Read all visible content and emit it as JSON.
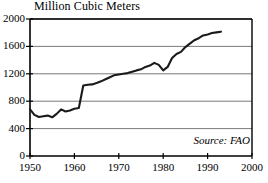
{
  "chart_data": {
    "type": "line",
    "title": "Million Cubic Meters",
    "xlabel": "",
    "ylabel": "",
    "xlim": [
      1950,
      2000
    ],
    "ylim": [
      0,
      2000
    ],
    "grid": true,
    "legend": null,
    "annotations": [
      {
        "name": "source",
        "text": "Source: FAO",
        "position": "bottom-right",
        "style": "italic"
      }
    ],
    "y_ticks": [
      0,
      400,
      800,
      1200,
      1600,
      2000
    ],
    "y_tick_labels": [
      "0",
      "400",
      "800",
      "1200",
      "1600",
      "2000"
    ],
    "x_ticks": [
      1950,
      1960,
      1970,
      1980,
      1990,
      2000
    ],
    "x_tick_labels": [
      "1950",
      "1960",
      "1970",
      "1980",
      "1990",
      "2000"
    ],
    "series": [
      {
        "name": "World fish catch",
        "color": "#1a1a1a",
        "x": [
          1950,
          1951,
          1952,
          1953,
          1954,
          1955,
          1956,
          1957,
          1958,
          1959,
          1960,
          1961,
          1962,
          1963,
          1964,
          1965,
          1966,
          1967,
          1968,
          1969,
          1970,
          1971,
          1972,
          1973,
          1974,
          1975,
          1976,
          1977,
          1978,
          1979,
          1980,
          1981,
          1982,
          1983,
          1984,
          1985,
          1986,
          1987,
          1988,
          1989,
          1990,
          1991,
          1992,
          1993
        ],
        "values": [
          680,
          600,
          570,
          580,
          590,
          565,
          615,
          680,
          650,
          665,
          690,
          700,
          1030,
          1040,
          1045,
          1065,
          1090,
          1120,
          1150,
          1180,
          1190,
          1200,
          1210,
          1230,
          1250,
          1265,
          1300,
          1320,
          1360,
          1330,
          1250,
          1300,
          1430,
          1490,
          1520,
          1590,
          1640,
          1690,
          1720,
          1760,
          1775,
          1795,
          1805,
          1815
        ]
      }
    ]
  },
  "plot_geometry": {
    "left": 30,
    "right": 252,
    "top": 19,
    "bottom": 156
  }
}
